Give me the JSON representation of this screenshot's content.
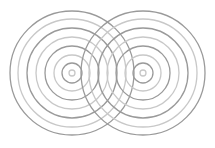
{
  "figure": {
    "width": 215,
    "height": 148,
    "background": "#ffffff",
    "colors": {
      "dark": "#9a9a9a",
      "light": "#c8c8c8"
    },
    "stroke_width": 1.3,
    "sources": [
      {
        "name": "left-source",
        "cx": 72,
        "cy": 73
      },
      {
        "name": "right-source",
        "cx": 143,
        "cy": 73
      }
    ],
    "rings": [
      {
        "r": 3,
        "shade": "light"
      },
      {
        "r": 10,
        "shade": "dark"
      },
      {
        "r": 18,
        "shade": "light"
      },
      {
        "r": 27,
        "shade": "dark"
      },
      {
        "r": 36,
        "shade": "light"
      },
      {
        "r": 45,
        "shade": "dark"
      },
      {
        "r": 54,
        "shade": "light"
      },
      {
        "r": 62,
        "shade": "dark"
      }
    ]
  }
}
